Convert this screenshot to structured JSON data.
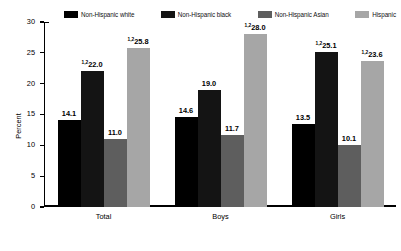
{
  "chart_data": {
    "type": "bar",
    "title": "",
    "subtitle": "",
    "xlabel": "",
    "ylabel": "Percent",
    "ylim": [
      0,
      30
    ],
    "yticks": [
      0,
      5,
      10,
      15,
      20,
      25,
      30
    ],
    "ytick_labels": [
      "0",
      "5",
      "10",
      "15",
      "20",
      "25",
      "30"
    ],
    "grid": false,
    "legend_position": "top",
    "categories": [
      "Total",
      "Boys",
      "Girls"
    ],
    "series": [
      {
        "name": "Non-Hispanic white",
        "color": "#000000",
        "values": [
          14.1,
          14.6,
          13.5
        ],
        "labels": [
          "14.1",
          "14.6",
          "13.5"
        ],
        "footnotes": [
          "",
          "",
          ""
        ]
      },
      {
        "name": "Non-Hispanic black",
        "color": "#141414",
        "values": [
          22.0,
          19.0,
          25.1
        ],
        "labels": [
          "22.0",
          "19.0",
          "25.1"
        ],
        "footnotes": [
          "1,2",
          "",
          "1,2"
        ]
      },
      {
        "name": "Non-Hispanic Asian",
        "color": "#5e5e5e",
        "values": [
          11.0,
          11.7,
          10.1
        ],
        "labels": [
          "11.0",
          "11.7",
          "10.1"
        ],
        "footnotes": [
          "",
          "",
          ""
        ]
      },
      {
        "name": "Hispanic",
        "color": "#a6a6a6",
        "values": [
          25.8,
          28.0,
          23.6
        ],
        "labels": [
          "25.8",
          "28.0",
          "23.6"
        ],
        "footnotes": [
          "1,2",
          "1,2",
          "1,2"
        ]
      }
    ]
  },
  "legend": {
    "items": [
      {
        "label": "Non-Hispanic white",
        "color": "#000000",
        "swatch_icon": "legend-swatch-icon"
      },
      {
        "label": "Non-Hispanic black",
        "color": "#141414",
        "swatch_icon": "legend-swatch-icon"
      },
      {
        "label": "Non-Hispanic Asian",
        "color": "#5e5e5e",
        "swatch_icon": "legend-swatch-icon"
      },
      {
        "label": "Hispanic",
        "color": "#a6a6a6",
        "swatch_icon": "legend-swatch-icon"
      }
    ]
  }
}
